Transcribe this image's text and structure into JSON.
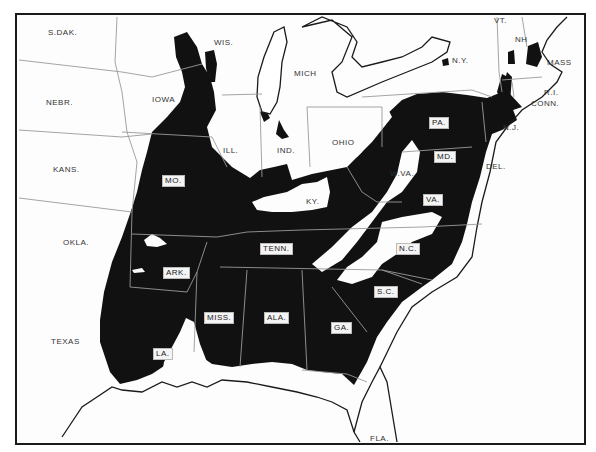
{
  "map": {
    "colors": {
      "shaded": "#111111",
      "land": "#fdfdfd",
      "water": "#ffffff",
      "border": "#1a1a1a",
      "state_line": "#888888"
    },
    "labels": {
      "sdak": "S.DAK.",
      "nebr": "NEBR.",
      "kans": "KANS.",
      "okla": "OKLA.",
      "texas": "TEXAS",
      "iowa": "IOWA",
      "wis": "WIS.",
      "mich": "MICH",
      "ill": "ILL.",
      "ind": "IND.",
      "ohio": "OHIO",
      "ny": "N.Y.",
      "vt": "VT.",
      "nh": "NH",
      "mass": "MASS",
      "ri": "R.I.",
      "conn": "CONN.",
      "nj": "N.J.",
      "del": "DEL.",
      "wva": "W.VA.",
      "ky": "KY.",
      "fla": "FLA."
    },
    "boxed_labels": {
      "mo": "MO.",
      "ark": "ARK.",
      "la": "LA.",
      "miss": "MISS.",
      "ala": "ALA.",
      "tenn": "TENN.",
      "ga": "GA.",
      "sc": "S.C.",
      "nc": "N.C.",
      "va": "VA.",
      "md": "MD.",
      "pa": "PA."
    }
  }
}
